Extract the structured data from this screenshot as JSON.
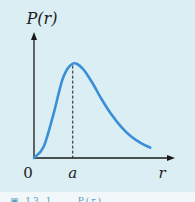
{
  "chart_data": {
    "type": "line",
    "title": "",
    "ylabel": "P(r)",
    "xlabel": "r",
    "x_ticks": [
      {
        "value": 0,
        "label": "0"
      },
      {
        "value": 1,
        "label": "a"
      }
    ],
    "xlim": [
      0,
      3.2
    ],
    "ylim": [
      0,
      1.25
    ],
    "annotations": [
      {
        "type": "vertical-dashed-line",
        "x": 1,
        "label": "a",
        "description": "peak at r = a"
      }
    ],
    "series": [
      {
        "name": "P(r)",
        "color": "#3a8fd6",
        "x": [
          0,
          0.25,
          0.5,
          0.75,
          1.0,
          1.25,
          1.5,
          1.75,
          2.0,
          2.25,
          2.5,
          2.75,
          3.0
        ],
        "y": [
          0,
          0.12,
          0.46,
          0.85,
          1.0,
          0.95,
          0.8,
          0.62,
          0.46,
          0.33,
          0.23,
          0.16,
          0.11
        ]
      }
    ],
    "grid": false,
    "legend": "none"
  },
  "caption_fragment": "▣ 13.1 ... P(r)"
}
